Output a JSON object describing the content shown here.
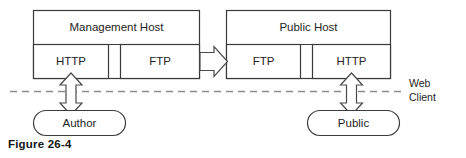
{
  "figure": {
    "caption": "Figure 26-4"
  },
  "hosts": [
    {
      "id": "management-host",
      "title": "Management Host",
      "services": [
        {
          "id": "management-http",
          "label": "HTTP"
        },
        {
          "id": "management-ftp",
          "label": "FTP"
        }
      ]
    },
    {
      "id": "public-host",
      "title": "Public Host",
      "services": [
        {
          "id": "public-ftp",
          "label": "FTP"
        },
        {
          "id": "public-http",
          "label": "HTTP"
        }
      ]
    }
  ],
  "actors": [
    {
      "id": "author",
      "label": "Author"
    },
    {
      "id": "public",
      "label": "Public"
    }
  ],
  "boundary": {
    "label_line1": "Web",
    "label_line2": "Client",
    "style": "dashed"
  },
  "connectors": [
    {
      "id": "ftp-transfer-arrow",
      "from": "management-ftp",
      "to": "public-ftp",
      "direction": "right",
      "label": ""
    },
    {
      "id": "author-http-arrow",
      "from": "author",
      "to": "management-http",
      "direction": "bidirectional",
      "label": ""
    },
    {
      "id": "public-http-arrow",
      "from": "public",
      "to": "public-http",
      "direction": "bidirectional",
      "label": ""
    }
  ],
  "colors": {
    "stroke": "#3a3a3a",
    "arrow_stroke": "#4a4a4a",
    "dash_stroke": "#8a8a8a",
    "text": "#242424",
    "background": "#ffffff"
  }
}
